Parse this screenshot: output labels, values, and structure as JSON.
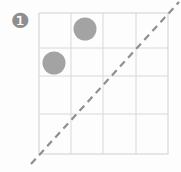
{
  "figure": {
    "item_label": "❶",
    "item_number": "6",
    "background_color": "#fdfdfd",
    "grid": {
      "rows": 4,
      "cols": 4,
      "x0": 39,
      "y0": 13,
      "x1": 168,
      "y1": 154,
      "line_color": "#d8d8d8",
      "border_color": "#cfcfcf",
      "line_width": 1,
      "x_lines": [
        39,
        71,
        103,
        136,
        168
      ],
      "y_lines": [
        13,
        48,
        76,
        114,
        154
      ]
    },
    "circles": [
      {
        "name": "circle-row1-col2",
        "row": 1,
        "col": 2,
        "cx": 85,
        "cy": 29,
        "r": 11.5,
        "fill": "#a3a3a3"
      },
      {
        "name": "circle-row2-col1",
        "row": 2,
        "col": 1,
        "cx": 54,
        "cy": 63,
        "r": 11.5,
        "fill": "#a3a3a3"
      }
    ],
    "diagonal": {
      "name": "dashed-diagonal-line",
      "x1": 31,
      "y1": 164,
      "x2": 179,
      "y2": 2,
      "stroke": "#8f8f8f",
      "stroke_width": 2.2,
      "dash": "7 5"
    }
  }
}
